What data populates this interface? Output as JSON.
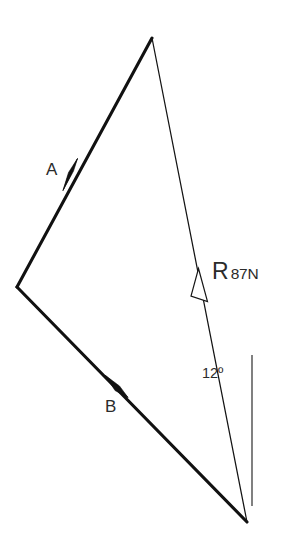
{
  "figure": {
    "kind": "vector-force-polygon-diagram",
    "background_color": "#ffffff",
    "stroke_color": "#111111",
    "width": 282,
    "height": 560
  },
  "vectors": {
    "a": {
      "name": "A",
      "label": "A",
      "style": "thick-solid",
      "arrowhead": "filled",
      "from": {
        "x": 17,
        "y": 287
      },
      "to": {
        "x": 152,
        "y": 38
      },
      "arrow_at": {
        "x": 70,
        "y": 172
      },
      "label_position": {
        "x": 46,
        "y": 161
      }
    },
    "b": {
      "name": "B",
      "label": "B",
      "style": "thick-solid",
      "arrowhead": "filled",
      "from": {
        "x": 17,
        "y": 287
      },
      "to": {
        "x": 247,
        "y": 522
      },
      "arrow_at": {
        "x": 118,
        "y": 387
      },
      "label_position": {
        "x": 105,
        "y": 398
      }
    },
    "r": {
      "name": "R",
      "label_symbol": "R",
      "label_magnitude": "87N",
      "magnitude_value": 87,
      "magnitude_unit": "N",
      "style": "thin-solid",
      "arrowhead": "open",
      "from": {
        "x": 247,
        "y": 522
      },
      "to": {
        "x": 152,
        "y": 38
      },
      "arrow_at": {
        "x": 203,
        "y": 286
      },
      "label_position": {
        "x": 212,
        "y": 260
      }
    }
  },
  "angle": {
    "label": "12º",
    "value": 12,
    "unit": "degrees",
    "between": "R and vertical reference",
    "label_position": {
      "x": 202,
      "y": 366
    }
  },
  "reference_line": {
    "name": "vertical-reference",
    "style": "thin-solid",
    "from": {
      "x": 252,
      "y": 355
    },
    "to": {
      "x": 252,
      "y": 506
    }
  }
}
